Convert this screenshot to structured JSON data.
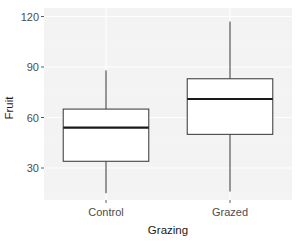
{
  "chart_data": {
    "type": "boxplot",
    "title": "",
    "xlabel": "Grazing",
    "ylabel": "Fruit",
    "categories": [
      "Control",
      "Grazed"
    ],
    "yticks": [
      30,
      60,
      90,
      120
    ],
    "ylim": [
      10,
      129
    ],
    "boxes": [
      {
        "name": "Control",
        "whisker_low": 15,
        "q1": 34,
        "median": 54,
        "q3": 65,
        "whisker_high": 88
      },
      {
        "name": "Grazed",
        "whisker_low": 16,
        "q1": 50,
        "median": 71,
        "q3": 83,
        "whisker_high": 117
      }
    ],
    "grid": true,
    "legend": null
  },
  "colors": {
    "panel_bg": "#f3f3f3",
    "grid_major": "#ffffff",
    "grid_minor": "#f9f9f9",
    "box_fill": "#ffffff",
    "box_line": "#333333",
    "median_line": "#1a1a1a"
  }
}
